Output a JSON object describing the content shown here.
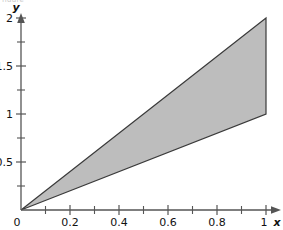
{
  "figure": {
    "caption_clipped": "figure",
    "background_color": "#ffffff",
    "axis_color": "#444444",
    "region_fill_color": "#bdbdbd",
    "region_stroke_color": "#3a3a3a"
  },
  "chart_data": {
    "type": "area",
    "title": "",
    "subtitle": "",
    "xlabel": "x",
    "ylabel": "y",
    "xlim": [
      0,
      1.06
    ],
    "ylim": [
      0,
      2.08
    ],
    "grid": false,
    "legend": null,
    "x_major_ticks": [
      0,
      0.2,
      0.4,
      0.6,
      0.8,
      1
    ],
    "x_major_tick_labels": [
      "0",
      "0.2",
      "0.4",
      "0.6",
      "0.8",
      "1"
    ],
    "x_minor_ticks": [
      0.1,
      0.3,
      0.5,
      0.7,
      0.9
    ],
    "y_major_ticks": [
      0,
      0.5,
      1,
      1.5,
      2
    ],
    "y_major_tick_labels": [
      "0",
      "0.5",
      "1",
      "1.5",
      "2"
    ],
    "y_minor_ticks": [
      0.25,
      0.75,
      1.25,
      1.75
    ],
    "shaded_region": {
      "name": "region-between-y-equals-2x-and-y-equals-x",
      "vertices": [
        [
          0,
          0
        ],
        [
          1,
          2
        ],
        [
          1,
          1
        ]
      ],
      "upper_boundary": {
        "equation": "y = 2x",
        "points": [
          [
            0,
            0
          ],
          [
            1,
            2
          ]
        ]
      },
      "lower_boundary": {
        "equation": "y = x",
        "points": [
          [
            0,
            0
          ],
          [
            1,
            1
          ]
        ]
      },
      "right_boundary": {
        "equation": "x = 1",
        "points": [
          [
            1,
            1
          ],
          [
            1,
            2
          ]
        ]
      },
      "fill": "#bdbdbd",
      "stroke": "#3a3a3a"
    },
    "series": [
      {
        "name": "upper boundary y = 2x",
        "type": "line",
        "x": [
          0,
          1
        ],
        "values": [
          0,
          2
        ]
      },
      {
        "name": "lower boundary y = x",
        "type": "line",
        "x": [
          0,
          1
        ],
        "values": [
          0,
          1
        ]
      },
      {
        "name": "right boundary x = 1",
        "type": "line",
        "x": [
          1,
          1
        ],
        "values": [
          1,
          2
        ]
      }
    ]
  }
}
